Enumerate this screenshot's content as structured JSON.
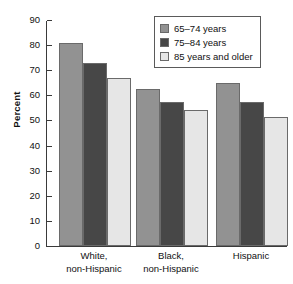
{
  "chart_data": {
    "type": "bar",
    "title": "",
    "xlabel": "",
    "ylabel": "Percent",
    "ylim": [
      0,
      90
    ],
    "yticks": [
      0,
      10,
      20,
      30,
      40,
      50,
      60,
      70,
      80,
      90
    ],
    "ytick_labels": [
      "0",
      "10",
      "20",
      "30",
      "40",
      "50",
      "60",
      "70",
      "80",
      "90"
    ],
    "grid": false,
    "legend_position": "top-right",
    "categories": [
      "White, non-Hispanic",
      "Black, non-Hispanic",
      "Hispanic"
    ],
    "category_lines": [
      [
        "White,",
        "non-Hispanic"
      ],
      [
        "Black,",
        "non-Hispanic"
      ],
      [
        "Hispanic",
        ""
      ]
    ],
    "series": [
      {
        "name": "65–74 years",
        "values": [
          81.0,
          62.5,
          65.0
        ],
        "color": "#929292"
      },
      {
        "name": "75–84 years",
        "values": [
          72.7,
          57.2,
          57.4
        ],
        "color": "#474747"
      },
      {
        "name": "85 years and older",
        "values": [
          67.0,
          54.0,
          51.2
        ],
        "color": "#e6e6e6"
      }
    ]
  },
  "legend": {
    "items": [
      {
        "label": "65–74 years"
      },
      {
        "label": "75–84 years"
      },
      {
        "label": "85 years and older"
      }
    ]
  },
  "axis": {
    "y_title": "Percent"
  }
}
